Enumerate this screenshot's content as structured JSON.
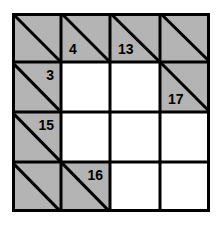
{
  "puzzle": {
    "type": "kakuro",
    "rows": 4,
    "cols": 4,
    "colors": {
      "clue_fill": "#c9c9c9",
      "line": "#000000",
      "empty_fill": "#ffffff"
    },
    "cells": [
      [
        {
          "kind": "clue",
          "down": "",
          "across": ""
        },
        {
          "kind": "clue",
          "down": "4",
          "across": ""
        },
        {
          "kind": "clue",
          "down": "13",
          "across": ""
        },
        {
          "kind": "clue",
          "down": "",
          "across": ""
        }
      ],
      [
        {
          "kind": "clue",
          "down": "",
          "across": "3"
        },
        {
          "kind": "empty",
          "value": ""
        },
        {
          "kind": "empty",
          "value": ""
        },
        {
          "kind": "clue",
          "down": "17",
          "across": ""
        }
      ],
      [
        {
          "kind": "clue",
          "down": "",
          "across": "15"
        },
        {
          "kind": "empty",
          "value": ""
        },
        {
          "kind": "empty",
          "value": ""
        },
        {
          "kind": "empty",
          "value": ""
        }
      ],
      [
        {
          "kind": "clue",
          "down": "",
          "across": ""
        },
        {
          "kind": "clue",
          "down": "",
          "across": "16"
        },
        {
          "kind": "empty",
          "value": ""
        },
        {
          "kind": "empty",
          "value": ""
        }
      ]
    ]
  }
}
